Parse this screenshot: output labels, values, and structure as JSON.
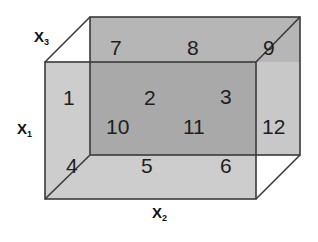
{
  "diagram": {
    "type": "3d-box-partition",
    "axes": {
      "x1": {
        "label": "X",
        "sub": "1"
      },
      "x2": {
        "label": "X",
        "sub": "2"
      },
      "x3": {
        "label": "X",
        "sub": "3"
      }
    },
    "cells": {
      "c1": "1",
      "c2": "2",
      "c3": "3",
      "c4": "4",
      "c5": "5",
      "c6": "6",
      "c7": "7",
      "c8": "8",
      "c9": "9",
      "c10": "10",
      "c11": "11",
      "c12": "12"
    },
    "colors": {
      "front_face": "#cdcdcd",
      "back_face": "#b4b4b4",
      "overlap": "#a9a9a9",
      "edge": "#3a3a3a"
    }
  }
}
